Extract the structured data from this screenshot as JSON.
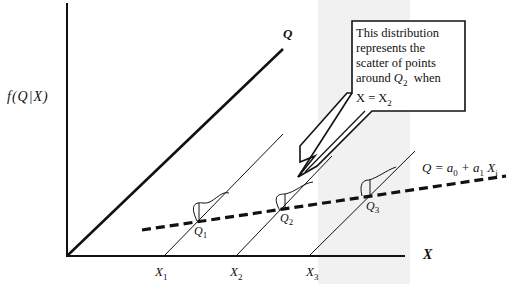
{
  "diagram": {
    "y_axis_label": "f(Q|X)",
    "x_axis_label": "X",
    "curve_label": "Q",
    "x_ticks": [
      {
        "base": "X",
        "sub": "1"
      },
      {
        "base": "X",
        "sub": "2"
      },
      {
        "base": "X",
        "sub": "3"
      }
    ],
    "points": [
      {
        "base": "Q",
        "sub": "1"
      },
      {
        "base": "Q",
        "sub": "2"
      },
      {
        "base": "Q",
        "sub": "3"
      }
    ],
    "regression_equation": {
      "lhs": "Q = a",
      "a0_sub": "0",
      "mid": " + a",
      "a1_sub": "1",
      "tail": " X",
      "xi_sub": "i"
    },
    "callout": {
      "line1": "This distribution",
      "line2": "represents the",
      "line3": "scatter of points",
      "line4_pre": "around ",
      "line4_var": "Q",
      "line4_sub": "2",
      "line4_post": "  when",
      "line5_pre": "X = X",
      "line5_sub": "2"
    },
    "colors": {
      "ink": "#111111",
      "band": "#f1f1f1",
      "background": "#ffffff"
    }
  }
}
